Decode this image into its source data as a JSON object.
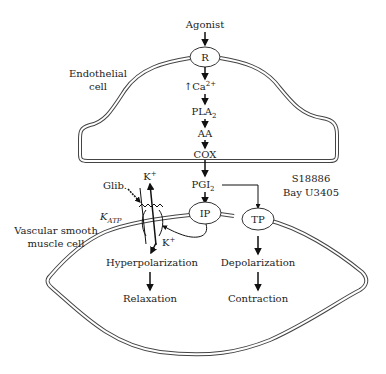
{
  "diagram": {
    "cells": {
      "endothelial_label_line1": "Endothelial",
      "endothelial_label_line2": "cell",
      "vsm_label_line1": "Vascular smooth",
      "vsm_label_line2": "muscle cell"
    },
    "pathway": {
      "agonist": "Agonist",
      "receptor": "R",
      "calcium": "Ca",
      "calcium_sup": "2+",
      "calcium_prefix": "↑",
      "pla2": "PLA",
      "pla2_sub": "2",
      "aa": "AA",
      "cox": "COX",
      "pgi2": "PGI",
      "pgi2_sub": "2"
    },
    "receptors": {
      "ip": "IP",
      "tp": "TP"
    },
    "antagonists": {
      "line1": "S18886",
      "line2": "Bay U3405"
    },
    "channel": {
      "name": "K",
      "name_sub": "ATP",
      "blocker": "Glib.",
      "ion_out": "K",
      "ion_out_sup": "+",
      "ion_in": "K",
      "ion_in_sup": "+"
    },
    "outcomes": {
      "ip_effect": "Hyperpolarization",
      "ip_result": "Relaxation",
      "tp_effect": "Depolarization",
      "tp_result": "Contraction"
    },
    "colors": {
      "line": "#222222",
      "membrane": "#444444",
      "background": "#ffffff"
    }
  }
}
